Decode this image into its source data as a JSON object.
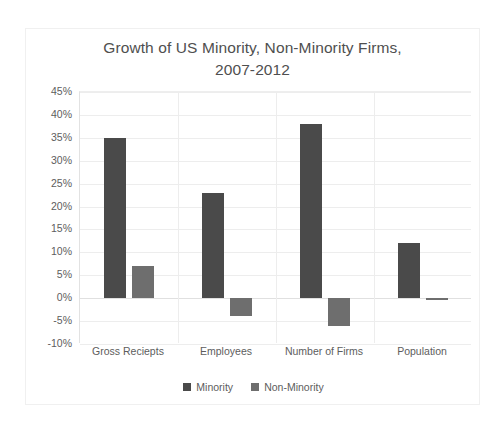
{
  "chart_data": {
    "type": "bar",
    "title": "Growth of US Minority, Non-Minority Firms, 2007-2012",
    "title_lines": [
      "Growth of US Minority, Non-Minority Firms,",
      "2007-2012"
    ],
    "xlabel": "",
    "ylabel": "",
    "categories": [
      "Gross Reciepts",
      "Employees",
      "Number of Firms",
      "Population"
    ],
    "series": [
      {
        "name": "Minority",
        "color": "#4a4a4a",
        "values": [
          35,
          23,
          38,
          12
        ]
      },
      {
        "name": "Non-Minority",
        "color": "#6e6e6e",
        "values": [
          7,
          -4,
          -6,
          -0.5
        ]
      }
    ],
    "ylim": [
      -10,
      45
    ],
    "ytick_step": 5,
    "ytick_labels": [
      "45%",
      "40%",
      "35%",
      "30%",
      "25%",
      "20%",
      "15%",
      "10%",
      "5%",
      "0%",
      "-5%",
      "-10%"
    ],
    "ytick_values": [
      45,
      40,
      35,
      30,
      25,
      20,
      15,
      10,
      5,
      0,
      -5,
      -10
    ],
    "value_suffix": "%",
    "grid": true,
    "legend_position": "bottom",
    "plot_background": "#ffffff",
    "grid_color": "#ededed",
    "text_color": "#5d5d5d",
    "title_color": "#4f4f4f"
  }
}
